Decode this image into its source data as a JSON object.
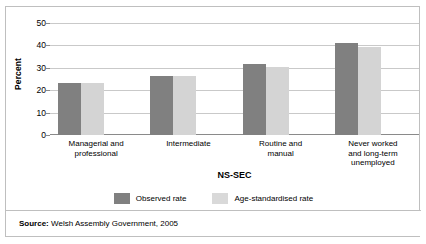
{
  "chart_data": {
    "type": "bar",
    "title": "",
    "xlabel": "NS-SEC",
    "ylabel": "Percent",
    "categories": [
      "Managerial and professional",
      "Intermediate",
      "Routine and manual",
      "Never worked and long-term unemployed"
    ],
    "category_lines": [
      [
        "Managerial and",
        "professional"
      ],
      [
        "Intermediate"
      ],
      [
        "Routine and",
        "manual"
      ],
      [
        "Never worked",
        "and long-term",
        "unemployed"
      ]
    ],
    "series": [
      {
        "name": "Observed rate",
        "color": "#808080",
        "values": [
          23,
          26.5,
          31.5,
          41
        ]
      },
      {
        "name": "Age-standardised rate",
        "color": "#d4d4d4",
        "values": [
          23,
          26.5,
          30.5,
          39.5
        ]
      }
    ],
    "ylim": [
      0,
      50
    ],
    "yticks": [
      0,
      10,
      20,
      30,
      40,
      50
    ],
    "ytick_labels": [
      "0",
      "10",
      "20",
      "30",
      "40",
      "50"
    ],
    "grid": true,
    "legend_position": "bottom"
  },
  "legend": {
    "items": [
      {
        "label": "Observed rate",
        "swatch": "dark-gray-swatch"
      },
      {
        "label": "Age-standardised rate",
        "swatch": "light-gray-swatch"
      }
    ]
  },
  "source": {
    "prefix": "Source:",
    "text": " Welsh Assembly Government, 2005"
  },
  "colors": {
    "observed": "#808080",
    "standardised": "#d4d4d4",
    "grid": "#c9c9c9",
    "frame": "#bfbfbf"
  }
}
